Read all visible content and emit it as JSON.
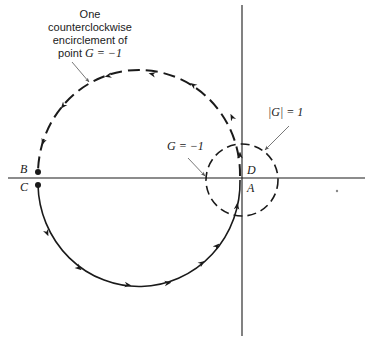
{
  "diagram": {
    "type": "nyquist-plot",
    "annotation_top": {
      "lines": [
        "One",
        "counterclockwise",
        "encirclement of"
      ],
      "last_line_prefix": "point ",
      "last_line_math": "G = −1"
    },
    "label_g_minus_one": "G = −1",
    "label_unit_circle": "|G| = 1",
    "points": {
      "B": "B",
      "C": "C",
      "D": "D",
      "A": "A"
    },
    "colors": {
      "ink": "#1a1a1a",
      "pointer": "#555555"
    },
    "curves": [
      {
        "name": "large-contour-upper",
        "style": "dashed",
        "direction": "counterclockwise",
        "from": "D",
        "to": "B"
      },
      {
        "name": "large-contour-lower",
        "style": "solid",
        "direction": "counterclockwise",
        "from": "C",
        "to": "A"
      },
      {
        "name": "unit-circle",
        "style": "dashed",
        "label": "|G| = 1"
      }
    ]
  }
}
